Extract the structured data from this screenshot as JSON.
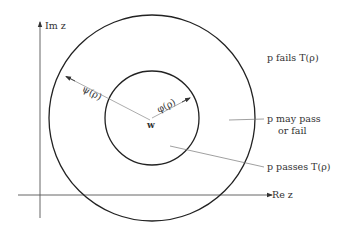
{
  "diagram": {
    "axes": {
      "imaginary_label": "Im z",
      "real_label": "Re z"
    },
    "center_label": "w",
    "outer_radius_label": "ψ(ρ)",
    "inner_radius_label": "φ(ρ)",
    "regions": {
      "outside": "p  fails  T(ρ)",
      "annulus_line1": "p  may pass",
      "annulus_line2": "or  fail",
      "inner": "p  passes  T(ρ)"
    },
    "colors": {
      "circle": "#222222",
      "axis": "#555555",
      "leader": "#777777",
      "text": "#333333"
    }
  }
}
